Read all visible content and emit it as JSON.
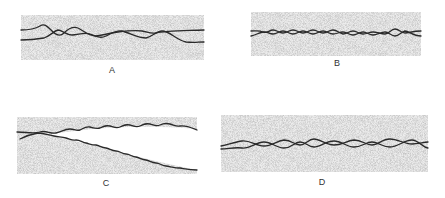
{
  "figure": {
    "background": "#ffffff",
    "stipple_color": "#c9c9c9",
    "line_color": "#2a2a2a",
    "panels": [
      {
        "id": "A",
        "label": "A",
        "rect": {
          "x": 21,
          "y": 15,
          "w": 183,
          "h": 45
        },
        "label_pos": {
          "x": 112,
          "y": 70
        },
        "description": "Two wavy lines intertwining irregularly with large loops, ending separated",
        "paths": [
          "M21,30 C30,30 35,29 40,26 C45,23 48,27 52,31 C56,35 60,37 64,33 C68,29 72,26 78,28 C84,31 88,36 96,36 C104,35 110,33 118,32 C126,31 134,30 142,31 C148,32 150,34 156,33 C164,31 176,31 204,30",
          "M21,40 C30,40 38,39 44,38 C50,36 54,31 58,30 C62,30 66,35 72,35 C78,35 84,32 90,34 C96,36 100,39 106,36 C112,33 116,30 122,31 C130,33 138,38 146,38 C152,37 156,31 162,31 C170,31 176,40 186,42 C194,43 198,42 204,42"
        ]
      },
      {
        "id": "B",
        "label": "B",
        "rect": {
          "x": 251,
          "y": 12,
          "w": 170,
          "h": 44
        },
        "label_pos": {
          "x": 337,
          "y": 63
        },
        "description": "Two tightly interwoven wavy lines with small regular oscillations",
        "paths": [
          "M251,31 C255,31 259,30 263,32 C267,34 269,30 273,30 C277,30 279,33 283,33 C287,33 289,30 293,30 C297,30 299,33 303,33 C307,33 309,30 313,30 C317,30 319,33 323,33 C327,33 329,30 333,30 C337,30 339,33 343,34 C347,34 349,31 353,31 C357,31 359,34 363,34 C367,34 369,32 373,32 C377,32 381,34 385,34 C389,34 391,29 395,29 C399,29 401,33 405,33 C409,33 413,31 421,31",
          "M251,36 C256,35 258,33 263,32 C267,31 269,34 273,34 C277,34 279,31 283,31 C287,31 289,34 293,34 C297,34 299,31 303,31 C307,31 309,34 313,34 C317,34 319,31 323,31 C327,31 329,34 333,34 C337,34 339,32 343,32 C347,32 349,35 353,35 C357,35 359,32 363,32 C367,32 369,35 373,35 C377,35 381,32 385,32 C389,32 391,36 395,36 C399,36 401,32 405,31 C409,31 413,36 421,36"
        ]
      },
      {
        "id": "C",
        "label": "C",
        "rect": {
          "x": 17,
          "y": 117,
          "w": 180,
          "h": 57
        },
        "label_pos": {
          "x": 106,
          "y": 183
        },
        "description": "Two wavy lines diverging: upper line stays roughly horizontal, lower line descends diagonally",
        "paths": [
          "M17,132 C26,132 34,134 40,132 C46,130 50,134 56,133 C62,132 64,129 70,129 C74,129 76,131 80,130 C84,128 86,126 90,127 C94,128 96,129 100,128 C104,126 106,125 110,126 C114,127 116,129 120,127 C124,125 126,124 130,125 C134,126 136,128 140,126 C144,124 146,123 150,124 C154,125 156,127 160,125 C164,123 166,123 170,124 C174,125 176,127 180,126 C186,125 192,128 197,130",
          "M20,139 C26,136 32,134 38,133 C44,133 48,135 54,136 C60,137 62,137 66,138 C70,139 72,141 76,140 C80,140 82,142 86,143 C90,144 92,145 96,145 C100,146 102,148 106,148 C110,149 112,151 116,151 C120,151 122,154 126,154 C130,154 132,157 136,157 C140,158 142,160 146,160 C150,161 152,163 156,163 C160,163 162,166 166,166 C172,167 176,168 180,168 C186,169 190,170 197,170"
        ]
      },
      {
        "id": "D",
        "label": "D",
        "rect": {
          "x": 221,
          "y": 115,
          "w": 207,
          "h": 57
        },
        "label_pos": {
          "x": 322,
          "y": 182
        },
        "description": "Two wavy lines of medium amplitude crossing repeatedly in a braid pattern",
        "paths": [
          "M221,146 C228,145 234,142 242,141 C250,140 256,146 264,146 C272,146 276,141 284,140 C292,140 294,145 300,145 C306,145 308,139 314,139 C320,139 326,145 334,145 C342,145 346,141 354,140 C362,140 366,145 372,145 C378,145 382,139 390,139 C398,139 404,144 412,144 C418,144 424,142 428,142",
          "M221,149 C228,149 234,147 242,148 C250,149 256,142 264,142 C272,142 276,148 284,148 C292,148 294,142 300,142 C306,142 308,147 314,147 C320,147 326,141 334,141 C342,141 346,147 354,147 C362,147 366,142 372,142 C378,142 382,147 390,147 C398,147 404,140 412,140 C418,140 424,148 428,148"
        ]
      }
    ]
  }
}
